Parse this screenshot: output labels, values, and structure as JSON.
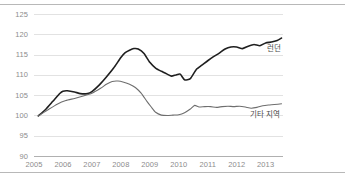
{
  "chart_data": {
    "type": "line",
    "title": "",
    "subtitle": "",
    "xlabel": "",
    "ylabel": "",
    "xlim": [
      2005,
      2013.6
    ],
    "ylim": [
      90,
      125
    ],
    "grid": true,
    "gridlines_y": [
      95,
      100,
      105,
      110,
      115,
      120,
      125
    ],
    "legend_position": "inline-right",
    "y_ticks": [
      "90",
      "95",
      "100",
      "105",
      "110",
      "115",
      "120",
      "125"
    ],
    "y_tick_values": [
      90,
      95,
      100,
      105,
      110,
      115,
      120,
      125
    ],
    "x_ticks": [
      "2005",
      "2006",
      "2007",
      "2008",
      "2009",
      "2010",
      "2011",
      "2012",
      "2013"
    ],
    "x_tick_values": [
      2005,
      2006,
      2007,
      2008,
      2009,
      2010,
      2011,
      2012,
      2013
    ],
    "series": [
      {
        "name": "런던",
        "color": "#1f1f1f",
        "width": 1.6,
        "x": [
          2005.15,
          2005.4,
          2005.65,
          2005.9,
          2006.0,
          2006.15,
          2006.4,
          2006.6,
          2006.85,
          2007.0,
          2007.25,
          2007.5,
          2007.75,
          2008.0,
          2008.15,
          2008.3,
          2008.45,
          2008.6,
          2008.8,
          2009.0,
          2009.2,
          2009.4,
          2009.6,
          2009.75,
          2009.9,
          2010.05,
          2010.2,
          2010.4,
          2010.6,
          2010.8,
          2011.0,
          2011.2,
          2011.4,
          2011.6,
          2011.8,
          2012.0,
          2012.2,
          2012.4,
          2012.6,
          2012.8,
          2013.0,
          2013.2,
          2013.4,
          2013.55
        ],
        "y": [
          100.0,
          101.6,
          103.6,
          105.6,
          106.1,
          106.2,
          105.9,
          105.5,
          105.5,
          106.0,
          107.6,
          109.6,
          111.8,
          114.4,
          115.6,
          116.2,
          116.6,
          116.5,
          115.4,
          113.2,
          111.8,
          111.0,
          110.3,
          109.8,
          110.1,
          110.3,
          108.9,
          109.2,
          111.4,
          112.5,
          113.6,
          114.6,
          115.5,
          116.5,
          117.0,
          117.0,
          116.6,
          117.2,
          117.6,
          117.3,
          118.0,
          118.2,
          118.6,
          119.2
        ]
      },
      {
        "name": "기타 지역",
        "color": "#6e6e6e",
        "width": 1.1,
        "x": [
          2005.15,
          2005.5,
          2005.8,
          2006.1,
          2006.4,
          2006.7,
          2007.0,
          2007.3,
          2007.5,
          2007.7,
          2007.9,
          2008.1,
          2008.3,
          2008.5,
          2008.7,
          2008.9,
          2009.05,
          2009.2,
          2009.4,
          2009.6,
          2009.8,
          2010.0,
          2010.2,
          2010.4,
          2010.55,
          2010.7,
          2010.9,
          2011.1,
          2011.3,
          2011.5,
          2011.7,
          2011.9,
          2012.1,
          2012.3,
          2012.5,
          2012.7,
          2012.9,
          2013.1,
          2013.3,
          2013.55
        ],
        "y": [
          100.0,
          101.6,
          102.9,
          103.8,
          104.3,
          104.9,
          105.6,
          106.8,
          107.8,
          108.5,
          108.6,
          108.3,
          107.8,
          107.0,
          105.6,
          103.6,
          102.2,
          100.9,
          100.2,
          100.1,
          100.2,
          100.3,
          100.8,
          101.7,
          102.6,
          102.2,
          102.3,
          102.3,
          102.1,
          102.3,
          102.4,
          102.3,
          102.4,
          102.2,
          101.9,
          102.1,
          102.5,
          102.7,
          102.8,
          103.0
        ]
      }
    ],
    "annotations": [
      {
        "text": "런던",
        "x": 2013.05,
        "y": 116.6
      },
      {
        "text": "기타 지역",
        "x": 2012.45,
        "y": 100.2
      }
    ],
    "colors": {
      "london_line": "#1f1f1f",
      "other_line": "#6e6e6e",
      "gridline": "#e2e2e2",
      "axis": "#b0b0b0",
      "tick_text": "#8c8c8c",
      "frame_rule": "#b8b8b8"
    }
  }
}
